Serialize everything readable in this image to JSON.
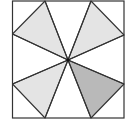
{
  "diagram": {
    "type": "geometry",
    "square": {
      "x1": 12.5,
      "y1": 1,
      "x2": 124,
      "y2": 118
    },
    "center": {
      "x": 68,
      "y": 60
    },
    "edge_points": [
      {
        "x": 45,
        "y": 1
      },
      {
        "x": 91,
        "y": 1
      },
      {
        "x": 124,
        "y": 35
      },
      {
        "x": 124,
        "y": 84
      },
      {
        "x": 91,
        "y": 118
      },
      {
        "x": 45,
        "y": 118
      },
      {
        "x": 12.5,
        "y": 84
      },
      {
        "x": 12.5,
        "y": 34
      }
    ],
    "shaded_triangles": [
      {
        "name": "top-left",
        "points": [
          [
            45,
            1
          ],
          [
            12.5,
            34
          ]
        ],
        "fill": "#e4e4e4"
      },
      {
        "name": "top-right",
        "points": [
          [
            91,
            1
          ],
          [
            124,
            35
          ]
        ],
        "fill": "#e4e4e4"
      },
      {
        "name": "bottom-right",
        "points": [
          [
            124,
            84
          ],
          [
            91,
            118
          ]
        ],
        "fill": "#b9b9b9"
      },
      {
        "name": "bottom-left",
        "points": [
          [
            45,
            118
          ],
          [
            12.5,
            84
          ]
        ],
        "fill": "#e4e4e4"
      }
    ],
    "colors": {
      "stroke": "#333333",
      "light_fill": "#e4e4e4",
      "dark_fill": "#b9b9b9",
      "background": "#ffffff"
    }
  }
}
